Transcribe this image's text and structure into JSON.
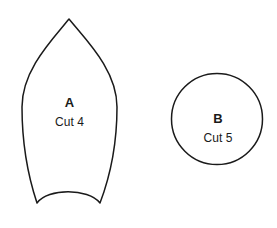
{
  "document": {
    "title": "Sewing Pattern Piece Layout",
    "background_color": "#ffffff",
    "stroke_color": "#1a1a1a",
    "fill_color": "#ffffff",
    "stroke_width": 1.5,
    "width": 277,
    "height": 228
  },
  "pieces": [
    {
      "id": "piece-a",
      "letter": "A",
      "cut_label": "Cut 4",
      "shape": "pointed-leaf",
      "apex": {
        "x": 69,
        "y": 19
      },
      "left_extent_x": 22,
      "right_extent_x": 117,
      "widest_y": 105,
      "bottom_left_point": {
        "x": 37,
        "y": 203
      },
      "bottom_right_point": {
        "x": 100,
        "y": 203
      },
      "bottom_notch_depth_y": 189,
      "path": "M 69 19 C 52 40 22 70 22 107 C 22 150 30 182 37 203 C 48 188 88 188 100 203 C 108 182 117 150 117 107 C 117 70 86 40 69 19 Z"
    },
    {
      "id": "piece-b",
      "letter": "B",
      "cut_label": "Cut 5",
      "shape": "circle",
      "center": {
        "x": 217,
        "y": 119
      },
      "radius": 45.5
    }
  ]
}
